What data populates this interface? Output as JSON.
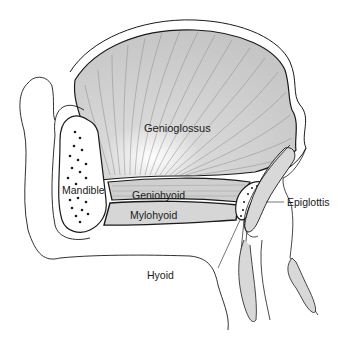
{
  "figure": {
    "type": "anatomical-diagram",
    "colors": {
      "muscle_fill": "#c9c9c9",
      "muscle_fiber": "#8a8a8a",
      "outline": "#1a1a1a",
      "bone_fill": "#ffffff",
      "background": "#ffffff"
    },
    "labels": {
      "genioglossus": "Genioglossus",
      "mandible": "Mandible",
      "geniohyoid": "Geniohyoid",
      "mylohyoid": "Mylohyoid",
      "hyoid": "Hyoid",
      "epiglottis": "Epiglottis"
    },
    "caption": "Fig. ... (caption cut off at bottom edge)"
  }
}
